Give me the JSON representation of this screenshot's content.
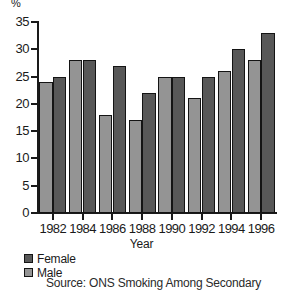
{
  "chart_data": {
    "type": "bar",
    "title": "",
    "xlabel": "Year",
    "ylabel": "%",
    "categories": [
      "1982",
      "1984",
      "1986",
      "1988",
      "1990",
      "1992",
      "1994",
      "1996"
    ],
    "series": [
      {
        "name": "Male",
        "color": "#949494",
        "values": [
          24,
          28,
          18,
          17,
          25,
          21,
          26,
          28
        ]
      },
      {
        "name": "Female",
        "color": "#585858",
        "values": [
          25,
          28,
          27,
          22,
          25,
          25,
          30,
          33
        ]
      }
    ],
    "ylim": [
      0,
      35
    ],
    "ytick_labels": [
      "35",
      "30",
      "25",
      "20",
      "15",
      "10",
      "5",
      "0"
    ],
    "ytick_values": [
      35,
      30,
      25,
      20,
      15,
      10,
      5,
      0
    ],
    "grid": false,
    "legend_position": "below-left",
    "bar_order_in_group": [
      "Male",
      "Female"
    ]
  },
  "axes": {
    "y_unit_label": "%",
    "x_title": "Year"
  },
  "legend": {
    "entries": [
      {
        "label": "Female",
        "swatch": "female"
      },
      {
        "label": "Male",
        "swatch": "male"
      }
    ]
  },
  "caption": {
    "source_text": "Source: ONS Smoking Among Secondary"
  }
}
